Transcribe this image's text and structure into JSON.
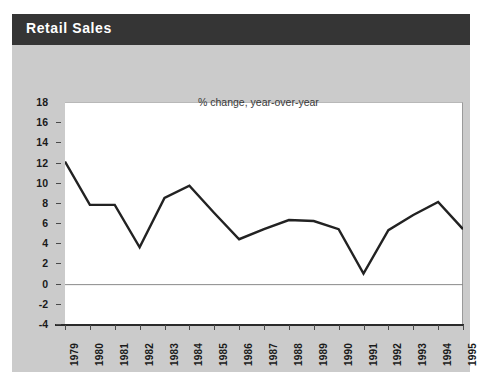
{
  "header": {
    "title": "Retail Sales"
  },
  "colors": {
    "title_bar": "#353535",
    "title_text": "#ffffff",
    "card_background": "#c9c9c9",
    "plot_background": "#ffffff",
    "line": "#222222",
    "axis": "#2b2b2b",
    "zero_line": "#8a8a8a"
  },
  "chart_data": {
    "type": "line",
    "title": "Retail Sales",
    "annotation": "% change, year-over-year",
    "xlabel": "",
    "ylabel": "",
    "categories": [
      "1979",
      "1980",
      "1981",
      "1982",
      "1983",
      "1984",
      "1985",
      "1986",
      "1987",
      "1988",
      "1989",
      "1990",
      "1991",
      "1992",
      "1993",
      "1994",
      "1995"
    ],
    "values": [
      12.2,
      7.9,
      7.9,
      3.7,
      8.6,
      9.8,
      7.1,
      4.5,
      5.5,
      6.4,
      6.3,
      5.5,
      1.1,
      5.4,
      6.9,
      8.2,
      5.5
    ],
    "series": [
      {
        "name": "% change, year-over-year",
        "values": [
          12.2,
          7.9,
          7.9,
          3.7,
          8.6,
          9.8,
          7.1,
          4.5,
          5.5,
          6.4,
          6.3,
          5.5,
          1.1,
          5.4,
          6.9,
          8.2,
          5.5
        ]
      }
    ],
    "ylim": [
      -4,
      18
    ],
    "yticks": [
      18,
      16,
      14,
      12,
      10,
      8,
      6,
      4,
      2,
      0,
      -2,
      -4
    ],
    "ytick_labels": [
      "18",
      "16",
      "14",
      "12",
      "10",
      "8",
      "6",
      "4",
      "2",
      "0",
      "-2",
      "-4"
    ],
    "xtick_labels": [
      "1979",
      "1980",
      "1981",
      "1982",
      "1983",
      "1984",
      "1985",
      "1986",
      "1987",
      "1988",
      "1989",
      "1990",
      "1991",
      "1992",
      "1993",
      "1994",
      "1995"
    ],
    "grid": false,
    "legend": "none",
    "zero_line": true
  }
}
